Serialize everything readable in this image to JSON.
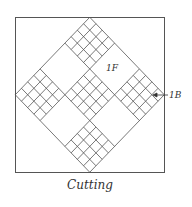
{
  "figure": {
    "caption": "Cutting",
    "labels": {
      "front": "1F",
      "back": "1B"
    },
    "grid": {
      "blocks_per_side": 3,
      "subdivisions_per_patch": 4,
      "checkered_blocks": [
        "top",
        "left",
        "center",
        "right",
        "bottom"
      ],
      "plain_blocks": [
        "top-left",
        "top-right",
        "bottom-left",
        "bottom-right"
      ]
    },
    "colors": {
      "line": "#555555",
      "background": "#ffffff"
    }
  }
}
